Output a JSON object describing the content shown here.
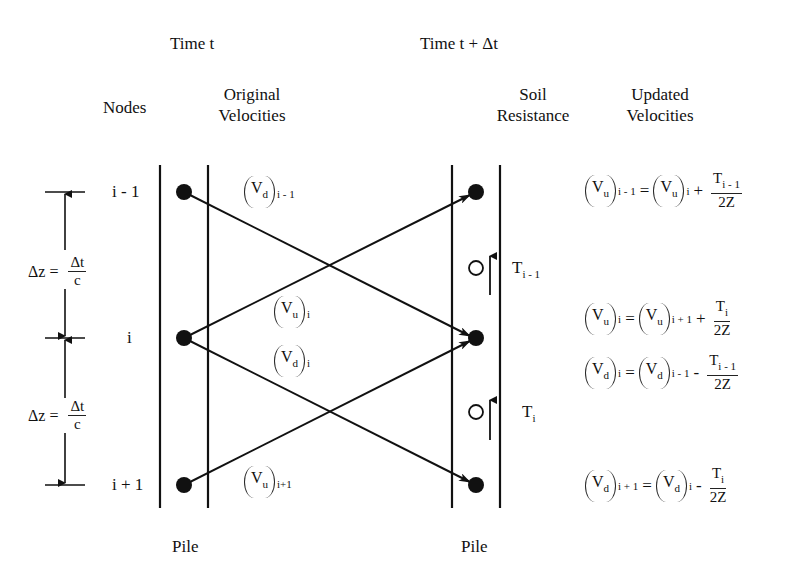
{
  "headers": {
    "time_t": "Time  t",
    "time_t_dt": "Time  t + Δt",
    "nodes": "Nodes",
    "original_velocities_line1": "Original",
    "original_velocities_line2": "Velocities",
    "soil_resistance_line1": "Soil",
    "soil_resistance_line2": "Resistance",
    "updated_velocities_line1": "Updated",
    "updated_velocities_line2": "Velocities"
  },
  "node_labels": [
    "i - 1",
    "i",
    "i + 1"
  ],
  "dimension": {
    "upper": {
      "lhs": "Δz =",
      "num": "Δt",
      "den": "c"
    },
    "lower": {
      "lhs": "Δz =",
      "num": "Δt",
      "den": "c"
    }
  },
  "wave_labels": {
    "vd_im1": {
      "var": "V",
      "sub_var": "d",
      "index": "i - 1"
    },
    "vu_i": {
      "var": "V",
      "sub_var": "u",
      "index": "i"
    },
    "vd_i": {
      "var": "V",
      "sub_var": "d",
      "index": "i"
    },
    "vu_ip1": {
      "var": "V",
      "sub_var": "u",
      "index": "i+1"
    }
  },
  "soil": {
    "upper": {
      "symbol": "O",
      "force": "T",
      "force_sub": "i - 1"
    },
    "lower": {
      "symbol": "O",
      "force": "T",
      "force_sub": "i"
    }
  },
  "equations": [
    {
      "lhs_var": "V",
      "lhs_sub": "u",
      "lhs_idx": "i - 1",
      "eq": "=",
      "rhs_var": "V",
      "rhs_sub": "u",
      "rhs_idx": "i",
      "op": "+",
      "num": "T",
      "num_sub": "i - 1",
      "den": "2Z"
    },
    {
      "lhs_var": "V",
      "lhs_sub": "u",
      "lhs_idx": "i",
      "eq": "=",
      "rhs_var": "V",
      "rhs_sub": "u",
      "rhs_idx": "i + 1",
      "op": "+",
      "num": "T",
      "num_sub": "i",
      "den": "2Z"
    },
    {
      "lhs_var": "V",
      "lhs_sub": "d",
      "lhs_idx": "i",
      "eq": "=",
      "rhs_var": "V",
      "rhs_sub": "d",
      "rhs_idx": "i - 1",
      "op": "-",
      "num": "T",
      "num_sub": "i - 1",
      "den": "2Z"
    },
    {
      "lhs_var": "V",
      "lhs_sub": "d",
      "lhs_idx": "i + 1",
      "eq": "=",
      "rhs_var": "V",
      "rhs_sub": "d",
      "rhs_idx": "i",
      "op": "-",
      "num": "T",
      "num_sub": "i",
      "den": "2Z"
    }
  ],
  "footers": {
    "pile_left": "Pile",
    "pile_right": "Pile"
  },
  "colors": {
    "ink": "#111111",
    "background": "#ffffff"
  }
}
